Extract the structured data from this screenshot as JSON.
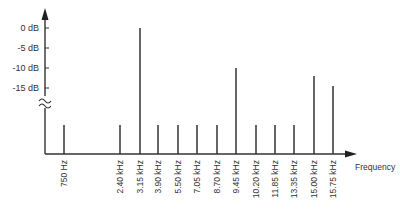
{
  "chart_data": {
    "type": "bar",
    "title": "",
    "xlabel": "Frequency",
    "ylabel": "",
    "y_ticks": [
      "0 dB",
      "-5 dB",
      "-10 dB",
      "-15 dB"
    ],
    "ylim": [
      -32,
      3
    ],
    "axis_break": true,
    "grid": false,
    "categories": [
      "750 Hz",
      "2.40 kHz",
      "3.15 kHz",
      "3.90 kHz",
      "5.50 kHz",
      "7.05 kHz",
      "8.70 kHz",
      "9.45 kHz",
      "10.20 kHz",
      "11.85 kHz",
      "13.35 kHz",
      "15.00 kHz",
      "15.75 kHz"
    ],
    "x_positions": [
      64,
      120,
      140,
      158,
      178,
      197,
      217,
      236,
      256,
      275,
      294,
      314,
      333
    ],
    "values": [
      -24,
      -24,
      0,
      -24,
      -24,
      -24,
      -24,
      -10,
      -24,
      -24,
      -24,
      -12,
      -14.5
    ]
  }
}
